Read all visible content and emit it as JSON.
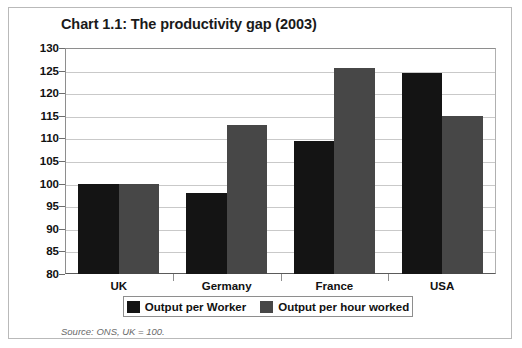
{
  "figure": {
    "title": "Chart 1.1: The productivity gap (2003)",
    "source_note": "Source: ONS, UK = 100."
  },
  "colors": {
    "series_worker": "#141414",
    "series_hour": "#474747",
    "gridline": "#c9c9c9",
    "axis": "#5a5a5a",
    "border": "#b9b9b9"
  },
  "chart_data": {
    "type": "bar",
    "title": "Chart 1.1: The productivity gap (2003)",
    "xlabel": "",
    "ylabel": "",
    "ylim": [
      80,
      130
    ],
    "ytick_step": 5,
    "yticks": [
      130,
      125,
      120,
      115,
      110,
      105,
      100,
      95,
      90,
      85,
      80
    ],
    "ytick_labels": [
      "130",
      "125",
      "120",
      "115",
      "110",
      "105",
      "100",
      "95",
      "90",
      "85",
      "80"
    ],
    "grid": true,
    "grid_axis": "y",
    "categories": [
      "UK",
      "Germany",
      "France",
      "USA"
    ],
    "series": [
      {
        "name": "Output per Worker",
        "color": "#141414",
        "values": [
          100,
          98,
          109.5,
          124.5
        ]
      },
      {
        "name": "Output per hour worked",
        "color": "#474747",
        "values": [
          100,
          113,
          125.5,
          115
        ]
      }
    ],
    "legend": [
      "Output per Worker",
      "Output per hour worked"
    ],
    "legend_position": "bottom",
    "annotations": [
      "Source: ONS, UK = 100."
    ]
  }
}
